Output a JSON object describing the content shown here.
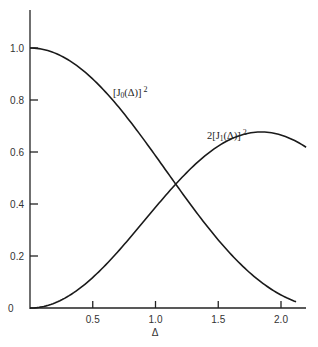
{
  "chart_data": {
    "type": "line",
    "title": "",
    "xlabel": "Δ",
    "ylabel": "",
    "xlim": [
      0,
      2.2
    ],
    "ylim": [
      0,
      1.1
    ],
    "grid": false,
    "x_ticks": [
      0.5,
      1.0,
      1.5,
      2.0
    ],
    "x_tick_labels": [
      "0.5",
      "1.0",
      "1.5",
      "2.0"
    ],
    "y_ticks": [
      0,
      0.2,
      0.4,
      0.6,
      0.8,
      1.0
    ],
    "y_tick_labels": [
      "0",
      "0.2",
      "0.4",
      "0.6",
      "0.8",
      "1.0"
    ],
    "series": [
      {
        "name": "[J0(Δ)]^2",
        "label_main": "[J",
        "label_sub": "0",
        "label_tail": "(Δ)]",
        "label_sup": "2",
        "function": "J0_squared",
        "x_range": [
          0,
          2.12
        ],
        "sample_points": [
          [
            0,
            1.0
          ],
          [
            0.5,
            0.882
          ],
          [
            1.0,
            0.585
          ],
          [
            1.16,
            0.47
          ],
          [
            1.5,
            0.262
          ],
          [
            2.0,
            0.05
          ]
        ]
      },
      {
        "name": "2[J1(Δ)]^2",
        "label_prefix": "2[J",
        "label_sub": "1",
        "label_tail": "(Δ)]",
        "label_sup": "2",
        "function": "two_J1_squared",
        "x_range": [
          0,
          2.2
        ],
        "sample_points": [
          [
            0,
            0.0
          ],
          [
            0.5,
            0.115
          ],
          [
            1.0,
            0.387
          ],
          [
            1.16,
            0.47
          ],
          [
            1.5,
            0.613
          ],
          [
            1.84,
            0.677
          ],
          [
            2.0,
            0.669
          ],
          [
            2.2,
            0.62
          ]
        ]
      }
    ]
  }
}
